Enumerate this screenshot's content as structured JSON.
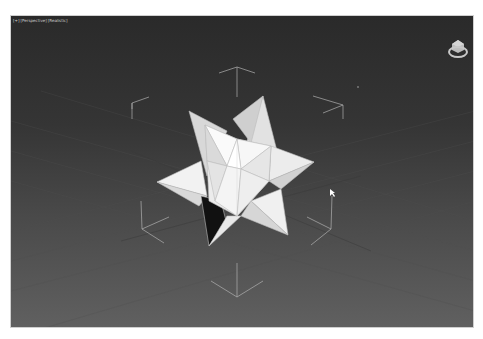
{
  "viewport": {
    "labels": [
      "[+]",
      "[Perspective]",
      "[Realistic]"
    ],
    "background_top": "#2a2a2a",
    "background_bottom": "#606060",
    "object": "small stellated dodecahedron",
    "object_color": "#e8e8e8",
    "selection_bracket_color": "#b8b8b8",
    "grid_color": "#555555"
  },
  "viewcube": {
    "icon": "viewcube-home-icon",
    "color": "#c8c8c8"
  },
  "cursor": {
    "icon": "mouse-pointer-icon",
    "x": 329,
    "y": 191
  }
}
